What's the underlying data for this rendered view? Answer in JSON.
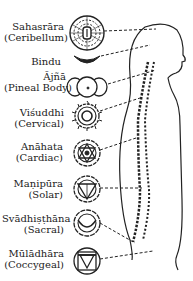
{
  "diagram": {
    "type": "chakra-body-map",
    "chakras": [
      {
        "name": "Sahasrāra",
        "region": "(Ceribellum)",
        "symbol": "thousand-petal-lotus-icon"
      },
      {
        "name": "Bindu",
        "region": "",
        "symbol": "crescent-icon"
      },
      {
        "name": "Ājñā",
        "region": "(Pineal Body)",
        "symbol": "two-petal-circle-icon"
      },
      {
        "name": "Viśuddhi",
        "region": "(Cervical)",
        "symbol": "sixteen-petal-circle-icon"
      },
      {
        "name": "Anāhata",
        "region": "(Cardiac)",
        "symbol": "hexagram-lotus-icon"
      },
      {
        "name": "Maṇipūra",
        "region": "(Solar)",
        "symbol": "downward-triangle-lotus-icon"
      },
      {
        "name": "Svādhiṣṭhāna",
        "region": "(Sacral)",
        "symbol": "crescent-lotus-icon"
      },
      {
        "name": "Mūlādhāra",
        "region": "(Coccygeal)",
        "symbol": "square-triangle-lotus-icon"
      }
    ],
    "figure": "human-profile-with-spine",
    "line_color": "#222222",
    "background": "#ffffff"
  }
}
